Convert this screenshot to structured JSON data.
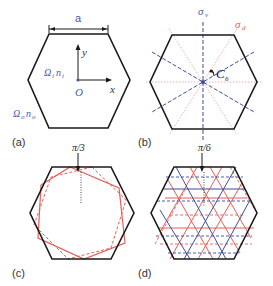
{
  "figure": {
    "panels": [
      {
        "id": "a",
        "label": "(a)",
        "annotations": {
          "width_label": "a",
          "y_axis": "y",
          "x_axis": "x",
          "origin": "O",
          "inner_medium": "Ω_i n_i",
          "outer_medium": "Ω_o n_o"
        }
      },
      {
        "id": "b",
        "label": "(b)",
        "annotations": {
          "sigma_v": "σv",
          "sigma_d": "σd",
          "rotation": "C6"
        }
      },
      {
        "id": "c",
        "label": "(c)",
        "annotations": {
          "angle": "π/3"
        }
      },
      {
        "id": "d",
        "label": "(d)",
        "annotations": {
          "angle": "π/6"
        }
      }
    ],
    "text": {
      "a_width": "a",
      "y_axis": "y",
      "x_axis": "x",
      "origin": "O",
      "omega_i": "Ω",
      "omega_i_sub": "i",
      "n_i": "n",
      "n_i_sub": "i",
      "omega_o": "Ω",
      "omega_o_sub": "o",
      "n_o": "n",
      "n_o_sub": "o",
      "sigma_v": "σ",
      "sigma_v_sub": "v",
      "sigma_d": "σ",
      "sigma_d_sub": "d",
      "c6": "C",
      "c6_sub": "6",
      "pi3": "π/3",
      "pi6": "π/6",
      "label_a": "(a)",
      "label_b": "(b)",
      "label_c": "(c)",
      "label_d": "(d)"
    },
    "colors": {
      "hexagon": "#1a1a1a",
      "blue": "#3f4c9a",
      "red": "#e0605a",
      "pink": "#e8a9a2",
      "annotation_blue": "#4b5aa8"
    }
  }
}
